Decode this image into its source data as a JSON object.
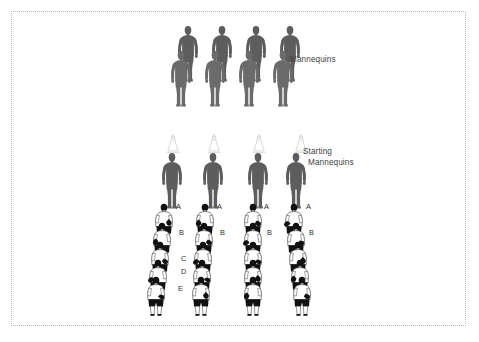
{
  "slide": {
    "width": 479,
    "height": 342,
    "background": "#ffffff",
    "frame_color": "#b9b9bd"
  },
  "colors": {
    "mannequin_gray": "#5d5d5d",
    "mannequin_gray_light": "#6b6b6b",
    "cone_outline": "#d8d8d8",
    "text": "#3f3f3f",
    "label_text": "#2e2e2e",
    "figure_shirt": "#ffffff",
    "figure_dark": "#111111"
  },
  "annotations": {
    "mannequins_label": "Mannequins",
    "starting_label_line1": "Starting",
    "starting_label_line2": "Mannequins"
  },
  "top_group": {
    "name": "mannequins-row-group",
    "count": 4,
    "pairs": [
      {
        "back": {
          "x": 175,
          "y": 25
        },
        "front": {
          "x": 168,
          "y": 50
        }
      },
      {
        "back": {
          "x": 209,
          "y": 25
        },
        "front": {
          "x": 202,
          "y": 50
        }
      },
      {
        "back": {
          "x": 243,
          "y": 25
        },
        "front": {
          "x": 236,
          "y": 50
        }
      },
      {
        "back": {
          "x": 277,
          "y": 25
        },
        "front": {
          "x": 270,
          "y": 50
        }
      }
    ]
  },
  "bottom_group": {
    "name": "starting-mannequins-group",
    "columns": [
      {
        "id": "column-1",
        "cone": {
          "x": 164,
          "y": 132
        },
        "mannequin": {
          "x": 159,
          "y": 152
        },
        "labels": [
          "A",
          "B",
          "C",
          "D",
          "E"
        ],
        "label_positions": [
          {
            "x": 176,
            "y": 203
          },
          {
            "x": 179,
            "y": 229
          },
          {
            "x": 181,
            "y": 255
          },
          {
            "x": 181,
            "y": 268
          },
          {
            "x": 178,
            "y": 285
          }
        ],
        "figures": [
          {
            "x": 149,
            "y": 203
          },
          {
            "x": 147,
            "y": 222
          },
          {
            "x": 145,
            "y": 241
          },
          {
            "x": 143,
            "y": 259
          },
          {
            "x": 141,
            "y": 276
          }
        ]
      },
      {
        "id": "column-2",
        "cone": {
          "x": 205,
          "y": 132
        },
        "mannequin": {
          "x": 200,
          "y": 152
        },
        "labels": [
          "A",
          "B"
        ],
        "label_positions": [
          {
            "x": 217,
            "y": 203
          },
          {
            "x": 220,
            "y": 229
          }
        ],
        "figures": [
          {
            "x": 190,
            "y": 203
          },
          {
            "x": 189,
            "y": 222
          },
          {
            "x": 188,
            "y": 241
          },
          {
            "x": 187,
            "y": 259
          },
          {
            "x": 186,
            "y": 276
          }
        ]
      },
      {
        "id": "column-3",
        "cone": {
          "x": 250,
          "y": 132
        },
        "mannequin": {
          "x": 245,
          "y": 152
        },
        "labels": [
          "A",
          "B"
        ],
        "label_positions": [
          {
            "x": 264,
            "y": 203
          },
          {
            "x": 267,
            "y": 229
          }
        ],
        "figures": [
          {
            "x": 238,
            "y": 203
          },
          {
            "x": 238,
            "y": 222
          },
          {
            "x": 238,
            "y": 241
          },
          {
            "x": 238,
            "y": 259
          },
          {
            "x": 238,
            "y": 276
          }
        ]
      },
      {
        "id": "column-4",
        "cone": {
          "x": 292,
          "y": 132
        },
        "mannequin": {
          "x": 283,
          "y": 152
        },
        "labels": [
          "A",
          "B"
        ],
        "label_positions": [
          {
            "x": 306,
            "y": 203
          },
          {
            "x": 309,
            "y": 229
          }
        ],
        "figures": [
          {
            "x": 279,
            "y": 203
          },
          {
            "x": 281,
            "y": 222
          },
          {
            "x": 283,
            "y": 241
          },
          {
            "x": 285,
            "y": 259
          },
          {
            "x": 287,
            "y": 276
          }
        ]
      }
    ]
  }
}
